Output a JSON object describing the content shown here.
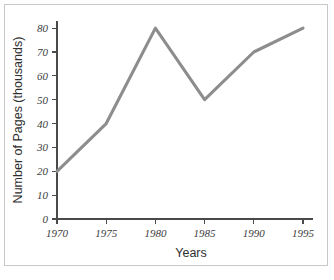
{
  "chart_data": {
    "type": "line",
    "title": "",
    "xlabel": "Years",
    "ylabel": "Number of Pages (thousands)",
    "x": [
      1970,
      1975,
      1980,
      1985,
      1990,
      1995
    ],
    "values": [
      20,
      40,
      80,
      50,
      70,
      80
    ],
    "series": [
      {
        "name": "Number of Pages",
        "values": [
          20,
          40,
          80,
          50,
          70,
          80
        ]
      }
    ],
    "xtick_labels": [
      "1970",
      "1975",
      "1980",
      "1985",
      "1990",
      "1995"
    ],
    "ytick_labels": [
      "0",
      "10",
      "20",
      "30",
      "40",
      "50",
      "60",
      "70",
      "80"
    ],
    "yticks": [
      0,
      10,
      20,
      30,
      40,
      50,
      60,
      70,
      80
    ],
    "xlim": [
      1970,
      1995
    ],
    "ylim": [
      0,
      83
    ],
    "grid": false,
    "legend": null,
    "line_color": "#8d8d8d",
    "axis_color": "#4a4a4a",
    "background_color": "#ffffff",
    "frame_color": "#c8c8c8"
  }
}
